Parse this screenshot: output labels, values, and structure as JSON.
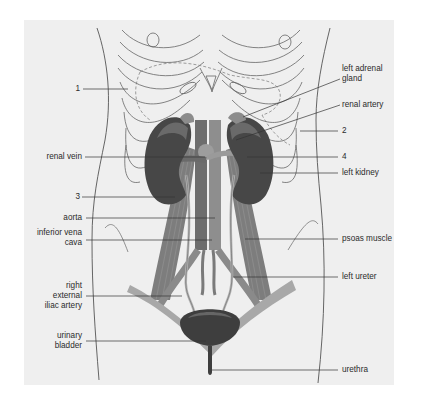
{
  "diagram": {
    "colors": {
      "background_panel": "#ececec",
      "outline": "#555555",
      "kidney": "#4a4a4a",
      "kidney_highlight": "#6e6e6e",
      "muscle": "#7a7a7a",
      "vessel": "#9a9a9a",
      "bladder": "#3f3f3f",
      "leader_line": "#333333",
      "label_text": "#2b2b2b"
    },
    "labels_left": [
      {
        "id": "1",
        "text": "1"
      },
      {
        "id": "renal-vein",
        "text": "renal vein"
      },
      {
        "id": "3",
        "text": "3"
      },
      {
        "id": "aorta",
        "text": "aorta"
      },
      {
        "id": "inferior-vena-cava",
        "line1": "inferior vena",
        "line2": "cava"
      },
      {
        "id": "right-external-iliac-artery",
        "line1": "right",
        "line2": "external",
        "line3": "iliac artery"
      },
      {
        "id": "urinary-bladder",
        "line1": "urinary",
        "line2": "bladder"
      }
    ],
    "labels_right": [
      {
        "id": "left-adrenal-gland",
        "line1": "left adrenal",
        "line2": "gland"
      },
      {
        "id": "renal-artery",
        "text": "renal artery"
      },
      {
        "id": "2",
        "text": "2"
      },
      {
        "id": "4",
        "text": "4"
      },
      {
        "id": "left-kidney",
        "text": "left kidney"
      },
      {
        "id": "psoas-muscle",
        "text": "psoas muscle"
      },
      {
        "id": "left-ureter",
        "text": "left ureter"
      },
      {
        "id": "urethra",
        "text": "urethra"
      }
    ]
  }
}
